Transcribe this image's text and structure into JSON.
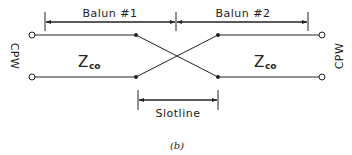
{
  "diagram": {
    "caption": "(b)",
    "dimensions": {
      "balun1": "Balun #1",
      "balun2": "Balun #2",
      "slotline": "Slotline"
    },
    "ports": {
      "left": "CPW",
      "right": "CPW"
    },
    "impedances": {
      "left": {
        "main": "Z",
        "sub": "co"
      },
      "right": {
        "main": "Z",
        "sub": "co"
      }
    },
    "colors": {
      "line": "#222222",
      "background": "#ffffff"
    }
  }
}
